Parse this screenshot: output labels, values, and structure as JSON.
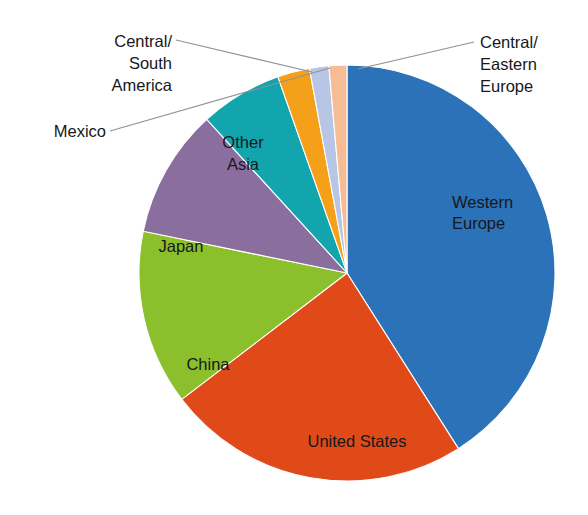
{
  "chart_data": {
    "type": "pie",
    "title": "",
    "subtitle": "",
    "xlabel": "",
    "ylabel": "",
    "legend_position": "none",
    "grid": false,
    "start_angle_deg_from_north": 0,
    "direction": "clockwise",
    "categories": [
      "Western Europe",
      "United States",
      "China",
      "Japan",
      "Other Asia",
      "Mexico",
      "Central/South America",
      "Central/Eastern Europe"
    ],
    "values": [
      41.0,
      23.6,
      13.6,
      10.0,
      6.4,
      2.5,
      1.5,
      1.4
    ],
    "colors": [
      "#2B72B8",
      "#E04A18",
      "#8CBF2C",
      "#8A6E9E",
      "#12A5AE",
      "#F5A019",
      "#B9C5E4",
      "#F6BC96"
    ],
    "slices": [
      {
        "label": "Western Europe",
        "value": 41.0,
        "color": "#2B72B8",
        "start_deg": 0.0,
        "end_deg": 147.6,
        "label_mode": "inside"
      },
      {
        "label": "United States",
        "value": 23.6,
        "color": "#E04A18",
        "start_deg": 147.6,
        "end_deg": 232.6,
        "label_mode": "inside"
      },
      {
        "label": "China",
        "value": 13.6,
        "color": "#8CBF2C",
        "start_deg": 232.6,
        "end_deg": 281.6,
        "label_mode": "inside"
      },
      {
        "label": "Japan",
        "value": 10.0,
        "color": "#8A6E9E",
        "start_deg": 281.6,
        "end_deg": 317.6,
        "label_mode": "inside"
      },
      {
        "label": "Other Asia",
        "value": 6.4,
        "color": "#12A5AE",
        "start_deg": 317.6,
        "end_deg": 340.6,
        "label_mode": "inside"
      },
      {
        "label": "Mexico",
        "value": 2.5,
        "color": "#F5A019",
        "start_deg": 340.6,
        "end_deg": 349.6,
        "label_mode": "callout"
      },
      {
        "label": "Central/South America",
        "value": 1.5,
        "color": "#B9C5E4",
        "start_deg": 349.6,
        "end_deg": 355.0,
        "label_mode": "callout"
      },
      {
        "label": "Central/Eastern Europe",
        "value": 1.4,
        "color": "#F6BC96",
        "start_deg": 355.0,
        "end_deg": 360.0,
        "label_mode": "callout"
      }
    ]
  },
  "geometry": {
    "center_x": 347,
    "center_y": 273,
    "radius": 208
  },
  "inside_labels": {
    "western_europe": {
      "line1": "Western",
      "line2": "Europe"
    },
    "united_states": {
      "line1": "United States"
    },
    "china": {
      "line1": "China"
    },
    "japan": {
      "line1": "Japan"
    },
    "other_asia": {
      "line1": "Other",
      "line2": "Asia"
    }
  },
  "callout_labels": {
    "central_south_america": {
      "line1": "Central/",
      "line2": "South",
      "line3": "America"
    },
    "mexico": {
      "line1": "Mexico"
    },
    "central_eastern_europe": {
      "line1": "Central/",
      "line2": "Eastern",
      "line3": "Europe"
    }
  }
}
